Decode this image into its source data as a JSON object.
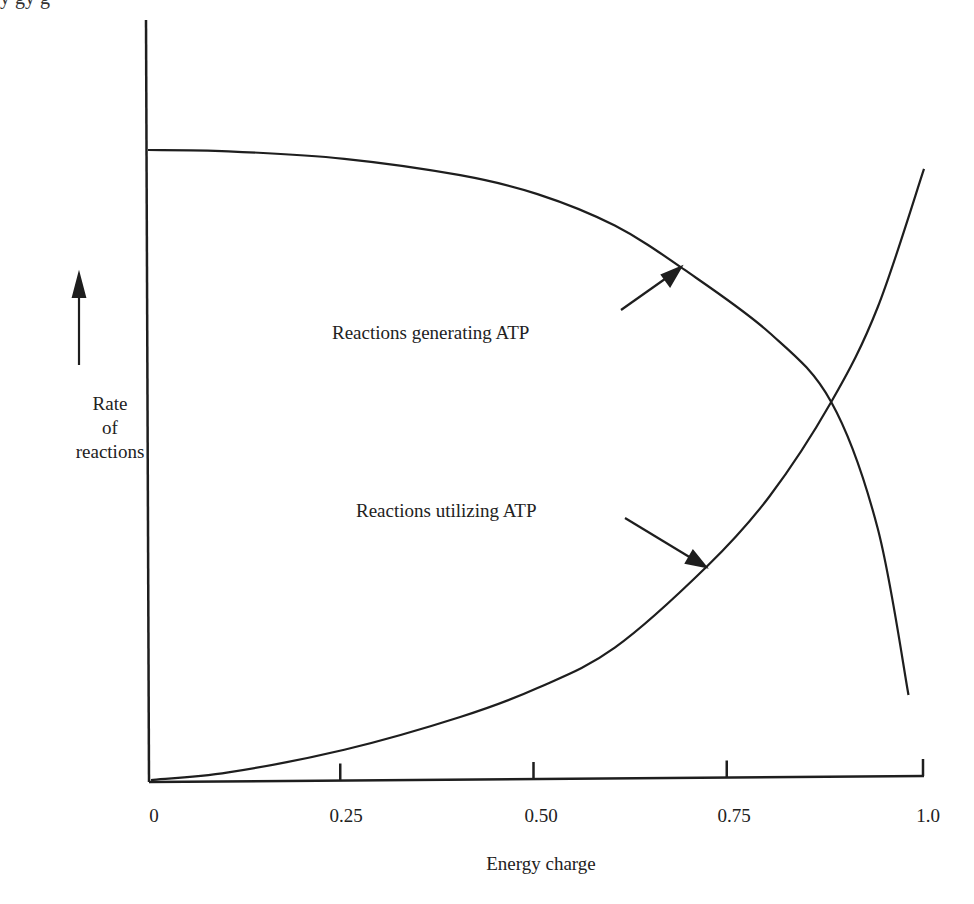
{
  "header_fragment": "y  gy  g",
  "chart_data": {
    "type": "line",
    "title": "",
    "xlabel": "Energy charge",
    "ylabel": "Rate of reactions",
    "ylabel_lines": [
      "Rate",
      "of",
      "reactions"
    ],
    "xlim": [
      0,
      1.0
    ],
    "ylim": [
      0,
      100
    ],
    "x_ticks": [
      0,
      0.25,
      0.5,
      0.75,
      1.0
    ],
    "x_tick_labels": [
      "0",
      "0.25",
      "0.50",
      "0.75",
      "1.0"
    ],
    "y_ticks": [],
    "grid": false,
    "legend": "none (inline arrow annotations)",
    "series": [
      {
        "name": "Reactions generating ATP",
        "x": [
          0,
          0.1,
          0.25,
          0.4,
          0.5,
          0.6,
          0.69,
          0.8,
          0.88,
          0.94,
          0.98
        ],
        "values": [
          100,
          99.8,
          98.6,
          96,
          93,
          88,
          81,
          71,
          60,
          40,
          13.5
        ]
      },
      {
        "name": "Reactions utilizing ATP",
        "x": [
          0,
          0.1,
          0.25,
          0.4,
          0.5,
          0.6,
          0.72,
          0.8,
          0.88,
          0.94,
          1.0
        ],
        "values": [
          0,
          1.2,
          4.8,
          10,
          14.6,
          21,
          34,
          45,
          60,
          75,
          97
        ]
      }
    ],
    "annotations": [
      {
        "text": "Reactions generating ATP",
        "points_to": {
          "x": 0.69,
          "y": 81
        }
      },
      {
        "text": "Reactions utilizing ATP",
        "points_to": {
          "x": 0.72,
          "y": 34
        }
      },
      {
        "text": "intersection",
        "at": {
          "x": 0.88,
          "y": 60
        }
      }
    ],
    "y_axis_arrow": "upward arrow indicating increasing rate"
  },
  "colors": {
    "ink": "#1e1e1e",
    "background": "#ffffff"
  }
}
